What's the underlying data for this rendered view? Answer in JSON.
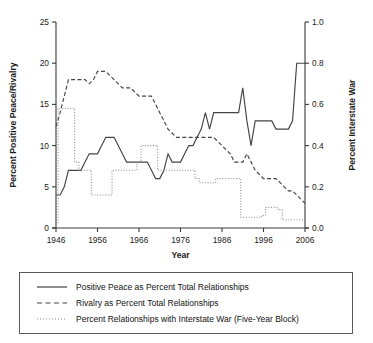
{
  "chart_data": {
    "type": "line",
    "title": "",
    "xlabel": "Year",
    "ylabel": "Percent Positive Peace/Rivalry",
    "y2label": "Percent Interstate War",
    "xlim": [
      1946,
      2006
    ],
    "ylim": [
      0,
      25
    ],
    "y2lim": [
      0.0,
      1.0
    ],
    "grid": false,
    "legend_position": "below-plot",
    "xticks": [
      1946,
      1956,
      1966,
      1976,
      1986,
      1996,
      2006
    ],
    "xtick_labels": [
      "1946",
      "1956",
      "1966",
      "1976",
      "1986",
      "1996",
      "2006"
    ],
    "yticks": [
      0,
      5,
      10,
      15,
      20,
      25
    ],
    "ytick_labels": [
      "0",
      "5",
      "10",
      "15",
      "20",
      "25"
    ],
    "y2ticks": [
      0.0,
      0.2,
      0.4,
      0.6,
      0.8,
      1.0
    ],
    "y2tick_labels": [
      "0.0",
      "0.2",
      "0.4",
      "0.6",
      "0.8",
      "1.0"
    ],
    "x": [
      1946,
      1947,
      1948,
      1949,
      1950,
      1951,
      1952,
      1953,
      1954,
      1955,
      1956,
      1957,
      1958,
      1959,
      1960,
      1961,
      1962,
      1963,
      1964,
      1965,
      1966,
      1967,
      1968,
      1969,
      1970,
      1971,
      1972,
      1973,
      1974,
      1975,
      1976,
      1977,
      1978,
      1979,
      1980,
      1981,
      1982,
      1983,
      1984,
      1985,
      1986,
      1987,
      1988,
      1989,
      1990,
      1991,
      1992,
      1993,
      1994,
      1995,
      1996,
      1997,
      1998,
      1999,
      2000,
      2001,
      2002,
      2003,
      2004,
      2005,
      2006
    ],
    "series": [
      {
        "name": "Positive Peace as Percent Total Relationships",
        "style": "solid",
        "axis": "left",
        "units": "percent",
        "values": [
          4,
          4,
          5,
          7,
          7,
          7,
          7,
          8,
          9,
          9,
          9,
          10,
          11,
          11,
          11,
          10,
          9,
          8,
          8,
          8,
          8,
          8,
          8,
          7,
          6,
          6,
          7,
          9,
          8,
          8,
          8,
          9,
          10,
          10,
          11,
          12,
          14,
          12,
          14,
          14,
          14,
          14,
          14,
          14,
          14,
          17,
          13,
          10,
          13,
          13,
          13,
          13,
          13,
          12,
          12,
          12,
          12,
          13,
          20,
          20,
          20
        ]
      },
      {
        "name": "Rivalry as Percent Total Relationships",
        "style": "dashed",
        "axis": "left",
        "units": "percent",
        "values": [
          12.3,
          14,
          16,
          18,
          18,
          18,
          18,
          18,
          17.5,
          18,
          19,
          19,
          19,
          18.5,
          18,
          17.5,
          17,
          17,
          17,
          16.5,
          16,
          16,
          16,
          16,
          15,
          14,
          13,
          12,
          11.5,
          11,
          11,
          11,
          11,
          11,
          11,
          11,
          11,
          11,
          11,
          10.5,
          10,
          9.5,
          9,
          8,
          8,
          8,
          9,
          8,
          7,
          6.5,
          6,
          6,
          6,
          6,
          5.5,
          5,
          4.5,
          4.5,
          4,
          3.5,
          3
        ]
      },
      {
        "name": "Percent Relationships with Interstate War (Five-Year Block)",
        "style": "dotted",
        "axis": "right",
        "units": "percent",
        "values_left_scale": [
          0.5,
          14.5,
          14.5,
          14.5,
          14.5,
          8,
          7,
          7,
          7,
          4,
          4,
          4,
          4,
          4,
          7,
          7,
          7,
          7,
          7,
          7,
          8,
          10,
          10,
          10,
          10,
          7,
          7,
          7,
          7,
          7,
          7,
          7,
          7,
          7,
          6,
          5.5,
          5.5,
          5.5,
          5.5,
          6,
          6,
          6,
          6,
          6,
          6,
          1.3,
          1.3,
          1.3,
          1.3,
          1.3,
          1.5,
          2.5,
          2.5,
          2.5,
          2.2,
          1,
          1,
          1,
          1,
          1,
          1
        ],
        "values": [
          0.02,
          0.58,
          0.58,
          0.58,
          0.58,
          0.32,
          0.28,
          0.28,
          0.28,
          0.16,
          0.16,
          0.16,
          0.16,
          0.16,
          0.28,
          0.28,
          0.28,
          0.28,
          0.28,
          0.28,
          0.32,
          0.4,
          0.4,
          0.4,
          0.4,
          0.28,
          0.28,
          0.28,
          0.28,
          0.28,
          0.28,
          0.28,
          0.28,
          0.28,
          0.24,
          0.22,
          0.22,
          0.22,
          0.22,
          0.24,
          0.24,
          0.24,
          0.24,
          0.24,
          0.24,
          0.05,
          0.05,
          0.05,
          0.05,
          0.05,
          0.06,
          0.1,
          0.1,
          0.1,
          0.09,
          0.04,
          0.04,
          0.04,
          0.04,
          0.04,
          0.04
        ]
      }
    ]
  },
  "legend": {
    "items": [
      {
        "label": "Positive Peace as Percent Total Relationships",
        "style": "solid"
      },
      {
        "label": "Rivalry as Percent Total Relationships",
        "style": "dashed"
      },
      {
        "label": "Percent Relationships with Interstate War (Five-Year Block)",
        "style": "dotted"
      }
    ]
  }
}
